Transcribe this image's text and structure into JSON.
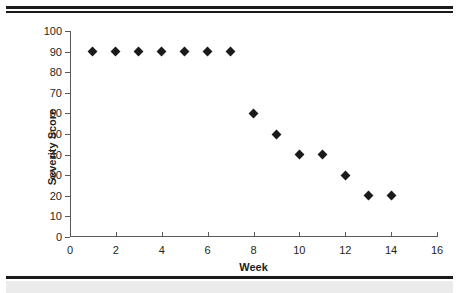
{
  "chart_data": {
    "type": "scatter",
    "title": "",
    "xlabel": "Week",
    "ylabel": "Severity Score",
    "xlim": [
      0,
      16
    ],
    "ylim": [
      0,
      100
    ],
    "xticks": [
      0,
      2,
      4,
      6,
      8,
      10,
      12,
      14,
      16
    ],
    "yticks": [
      0,
      10,
      20,
      30,
      40,
      50,
      60,
      70,
      80,
      90,
      100
    ],
    "grid": false,
    "legend": "none",
    "marker": "diamond",
    "marker_color": "#1a1a1a",
    "x": [
      1,
      2,
      3,
      4,
      5,
      6,
      7,
      8,
      9,
      10,
      11,
      12,
      13,
      14
    ],
    "values": [
      90,
      90,
      90,
      90,
      90,
      90,
      90,
      60,
      50,
      40,
      40,
      30,
      20,
      20
    ],
    "series": [
      {
        "name": "Severity Score",
        "points": [
          {
            "x": 1,
            "y": 90
          },
          {
            "x": 2,
            "y": 90
          },
          {
            "x": 3,
            "y": 90
          },
          {
            "x": 4,
            "y": 90
          },
          {
            "x": 5,
            "y": 90
          },
          {
            "x": 6,
            "y": 90
          },
          {
            "x": 7,
            "y": 90
          },
          {
            "x": 8,
            "y": 60
          },
          {
            "x": 9,
            "y": 50
          },
          {
            "x": 10,
            "y": 40
          },
          {
            "x": 11,
            "y": 40
          },
          {
            "x": 12,
            "y": 30
          },
          {
            "x": 13,
            "y": 20
          },
          {
            "x": 14,
            "y": 20
          }
        ]
      }
    ]
  },
  "figure": {
    "background": "#ffffff",
    "axis_color": "#58595b",
    "text_color": "#231f20",
    "rule_color": "#1a1a1a",
    "strip_color": "#ebebeb"
  }
}
